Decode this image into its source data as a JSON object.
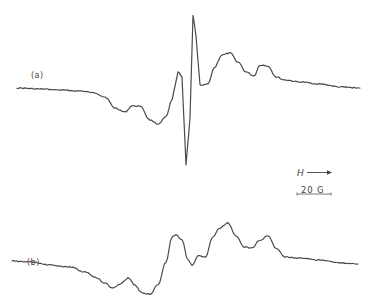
{
  "chart_data": {
    "type": "line",
    "title": "",
    "xlabel": "",
    "ylabel": "",
    "grid": false,
    "legend": "none",
    "annotations": [
      {
        "text": "H",
        "meaning": "magnetic field direction",
        "arrow": "right"
      },
      {
        "text": "20 G",
        "meaning": "field scale bar"
      }
    ],
    "series": [
      {
        "name": "(a)",
        "x": [
          17,
          40,
          60,
          80,
          95,
          105,
          115,
          125,
          132,
          140,
          150,
          158,
          166,
          172,
          178,
          182,
          186,
          190,
          193,
          196,
          200,
          204,
          208,
          214,
          222,
          230,
          238,
          246,
          254,
          260,
          268,
          276,
          285,
          300,
          320,
          340,
          360
        ],
        "y": [
          88,
          89,
          90,
          91,
          93,
          97,
          108,
          112,
          106,
          106,
          120,
          124,
          117,
          100,
          72,
          77,
          165,
          118,
          15,
          36,
          85,
          85,
          84,
          68,
          55,
          53,
          62,
          72,
          76,
          65,
          66,
          77,
          80,
          82,
          84,
          87,
          88
        ]
      },
      {
        "name": "(b)",
        "x": [
          12,
          30,
          50,
          70,
          85,
          95,
          105,
          112,
          120,
          128,
          135,
          142,
          150,
          158,
          166,
          172,
          176,
          182,
          188,
          192,
          198,
          206,
          212,
          220,
          228,
          236,
          244,
          252,
          260,
          268,
          276,
          285,
          300,
          320,
          340,
          358
        ],
        "y": [
          261,
          262,
          265,
          267,
          272,
          277,
          283,
          288,
          284,
          278,
          285,
          293,
          294,
          285,
          262,
          237,
          235,
          240,
          260,
          265,
          256,
          257,
          238,
          228,
          223,
          236,
          247,
          248,
          240,
          236,
          248,
          257,
          258,
          260,
          263,
          264
        ]
      }
    ]
  },
  "labels": {
    "a": "(a)",
    "b": "(b)",
    "field": "H",
    "scale": "20 G"
  }
}
